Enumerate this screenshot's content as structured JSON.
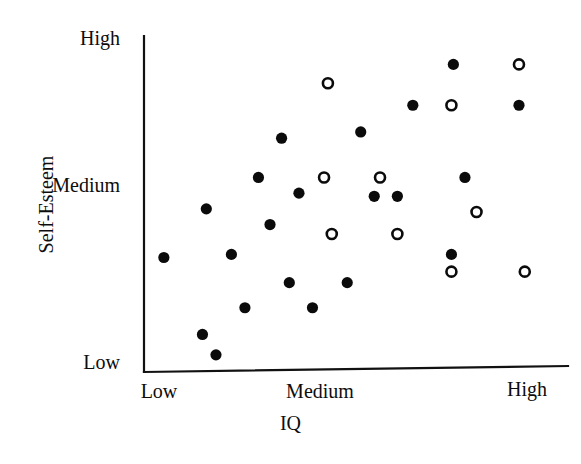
{
  "chart_data": {
    "type": "scatter",
    "title": "",
    "xlabel": "IQ",
    "ylabel": "Self-Esteem",
    "grid": false,
    "legend_position": "none",
    "xlim": [
      0,
      100
    ],
    "ylim": [
      0,
      100
    ],
    "x_tick_labels": [
      "Low",
      "Medium",
      "High"
    ],
    "x_tick_values": [
      0,
      50,
      100
    ],
    "y_tick_labels": [
      "Low",
      "Medium",
      "High"
    ],
    "y_tick_values": [
      0,
      50,
      100
    ],
    "axis_color": "#111111",
    "marker_color": "#0b0b0b",
    "series": [
      {
        "name": "filled",
        "marker": "filled-circle",
        "points": [
          [
            1.0,
            32.0
          ],
          [
            11.0,
            7.5
          ],
          [
            12.0,
            47.5
          ],
          [
            14.5,
            1.0
          ],
          [
            18.5,
            33.0
          ],
          [
            22.0,
            16.0
          ],
          [
            25.5,
            57.5
          ],
          [
            28.5,
            42.5
          ],
          [
            31.5,
            70.0
          ],
          [
            33.5,
            24.0
          ],
          [
            36.0,
            52.5
          ],
          [
            39.5,
            16.0
          ],
          [
            48.5,
            24.0
          ],
          [
            52.0,
            72.0
          ],
          [
            55.5,
            51.5
          ],
          [
            61.5,
            51.5
          ],
          [
            65.5,
            80.5
          ],
          [
            76.0,
            93.5
          ],
          [
            79.0,
            57.5
          ],
          [
            75.5,
            33.0
          ],
          [
            93.0,
            80.5
          ]
        ]
      },
      {
        "name": "open",
        "marker": "open-circle",
        "points": [
          [
            43.5,
            87.5
          ],
          [
            42.5,
            57.5
          ],
          [
            44.5,
            39.5
          ],
          [
            57.0,
            57.5
          ],
          [
            61.5,
            39.5
          ],
          [
            75.5,
            80.5
          ],
          [
            82.0,
            46.5
          ],
          [
            75.5,
            27.5
          ],
          [
            93.0,
            93.5
          ],
          [
            94.5,
            27.5
          ]
        ]
      }
    ]
  },
  "axis_ticks": {
    "y": [
      {
        "label": "High"
      },
      {
        "label": "Medium"
      },
      {
        "label": "Low"
      }
    ],
    "x": [
      {
        "label": "Low"
      },
      {
        "label": "Medium"
      },
      {
        "label": "High"
      }
    ]
  },
  "titles": {
    "x": "IQ",
    "y": "Self-Esteem"
  }
}
